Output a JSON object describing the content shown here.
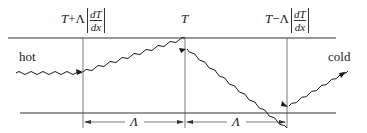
{
  "diagram": {
    "labels": {
      "left_position": {
        "prefix": "T",
        "op": "+",
        "lambda": "Λ",
        "num": "dT",
        "den": "dx"
      },
      "center_position": "T",
      "right_position": {
        "prefix": "T",
        "op": "−",
        "lambda": "Λ",
        "num": "dT",
        "den": "dx"
      },
      "hot": "hot",
      "cold": "cold",
      "spacing_left": "Λ",
      "spacing_right": "Λ"
    },
    "colors": {
      "line": "#333333",
      "wave": "#1a1a1a"
    }
  }
}
